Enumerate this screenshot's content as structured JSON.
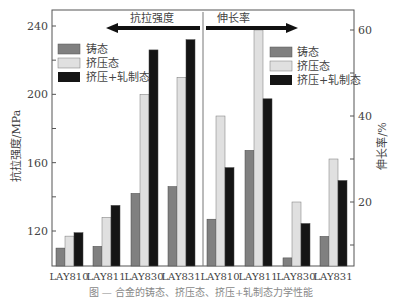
{
  "chart_data": {
    "type": "bar",
    "title": "",
    "categories": [
      "LAY810",
      "LAY811",
      "LAY830",
      "LAY831"
    ],
    "panels": [
      {
        "name": "抗拉强度",
        "axis": "left",
        "ylabel": "抗拉强度/MPa",
        "ylim": [
          100,
          250
        ],
        "yticks": [
          120,
          160,
          200,
          240
        ],
        "arrow_direction": "left",
        "series": [
          {
            "name": "铸态",
            "color": "#808080",
            "values": [
              110,
              111,
              142,
              146
            ]
          },
          {
            "name": "挤压态",
            "color": "#e0e0e0",
            "values": [
              117,
              128,
              200,
              210
            ]
          },
          {
            "name": "挤压+轧制态",
            "color": "#151515",
            "values": [
              119,
              135,
              226,
              232
            ]
          }
        ]
      },
      {
        "name": "伸长率",
        "axis": "right",
        "ylabel": "伸长率/%",
        "ylim": [
          5,
          63
        ],
        "yticks": [
          20,
          40,
          60
        ],
        "arrow_direction": "right",
        "series": [
          {
            "name": "铸态",
            "color": "#808080",
            "values": [
              16,
              32,
              7,
              12
            ]
          },
          {
            "name": "挤压态",
            "color": "#e0e0e0",
            "values": [
              40,
              60,
              20,
              30
            ]
          },
          {
            "name": "挤压+轧制态",
            "color": "#151515",
            "values": [
              28,
              44,
              15,
              25
            ]
          }
        ]
      }
    ],
    "legend": [
      "铸态",
      "挤压态",
      "挤压+轧制态"
    ],
    "legend_position": "upper-left of each panel",
    "grid": false
  },
  "labels": {
    "left_ylabel": "抗拉强度/MPa",
    "right_ylabel": "伸长率/%",
    "left_section_title": "抗拉强度",
    "right_section_title": "伸长率",
    "left_ticks": [
      "240",
      "200",
      "160",
      "120"
    ],
    "right_ticks": [
      "60",
      "40",
      "20"
    ],
    "xticks": [
      "LAY810",
      "LAY811",
      "LAY830",
      "LAY831",
      "LAY810",
      "LAY811",
      "LAY830",
      "LAY831"
    ],
    "legend_cast": "铸态",
    "legend_extruded": "挤压态",
    "legend_rolled": "挤压+轧制态"
  },
  "caption": "图 — 合金的铸态、挤压态、挤压+轧制态力学性能"
}
